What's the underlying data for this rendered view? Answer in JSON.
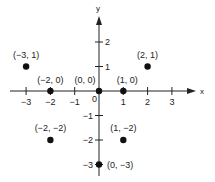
{
  "chart_data": {
    "type": "scatter",
    "title": "",
    "xlabel": "x",
    "ylabel": "y",
    "xlim": [
      -3.5,
      4
    ],
    "ylim": [
      -3.3,
      3
    ],
    "grid": false,
    "x_ticks": [
      "-3",
      "-2",
      "-1",
      "0",
      "1",
      "2",
      "3"
    ],
    "y_ticks": [
      "2",
      "1",
      "-1",
      "-2",
      "-3"
    ],
    "points": [
      {
        "x": -3,
        "y": 1,
        "label": "(-3, 1)"
      },
      {
        "x": -2,
        "y": 0,
        "label": "(-2, 0)"
      },
      {
        "x": 0,
        "y": 0,
        "label": "(0, 0)"
      },
      {
        "x": 1,
        "y": 0,
        "label": "(1, 0)"
      },
      {
        "x": 2,
        "y": 1,
        "label": "(2, 1)"
      },
      {
        "x": -2,
        "y": -2,
        "label": "(-2, -2)"
      },
      {
        "x": 1,
        "y": -2,
        "label": "(1, -2)"
      },
      {
        "x": 0,
        "y": -3,
        "label": "(0, -3)"
      }
    ]
  },
  "axes": {
    "x_name": "x",
    "y_name": "y",
    "origin_label": "0"
  }
}
